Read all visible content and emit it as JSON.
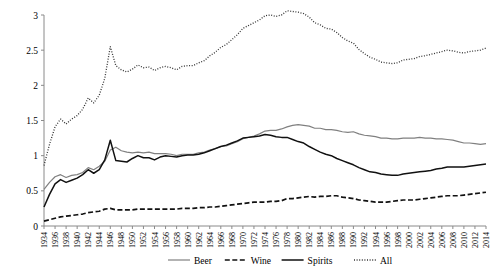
{
  "chart_data": {
    "type": "line",
    "title": "",
    "subtitle": "",
    "xlabel": "",
    "ylabel": "",
    "xlim": [
      1934,
      2014
    ],
    "ylim": [
      0,
      3
    ],
    "yticks": [
      "0",
      "0.5",
      "1",
      "1.5",
      "2",
      "2.5",
      "3"
    ],
    "ytick_values": [
      0,
      0.5,
      1,
      1.5,
      2,
      2.5,
      3
    ],
    "grid": false,
    "legend_position": "bottom",
    "x": [
      1934,
      1935,
      1936,
      1937,
      1938,
      1939,
      1940,
      1941,
      1942,
      1943,
      1944,
      1945,
      1946,
      1947,
      1948,
      1949,
      1950,
      1951,
      1952,
      1953,
      1954,
      1955,
      1956,
      1957,
      1958,
      1959,
      1960,
      1961,
      1962,
      1963,
      1964,
      1965,
      1966,
      1967,
      1968,
      1969,
      1970,
      1971,
      1972,
      1973,
      1974,
      1975,
      1976,
      1977,
      1978,
      1979,
      1980,
      1981,
      1982,
      1983,
      1984,
      1985,
      1986,
      1987,
      1988,
      1989,
      1990,
      1991,
      1992,
      1993,
      1994,
      1995,
      1996,
      1997,
      1998,
      1999,
      2000,
      2001,
      2002,
      2003,
      2004,
      2005,
      2006,
      2007,
      2008,
      2009,
      2010,
      2011,
      2012,
      2013,
      2014
    ],
    "xtick_labels": [
      "1934",
      "1936",
      "1938",
      "1940",
      "1942",
      "1944",
      "1946",
      "1948",
      "1950",
      "1952",
      "1954",
      "1956",
      "1958",
      "1960",
      "1962",
      "1964",
      "1966",
      "1968",
      "1970",
      "1972",
      "1974",
      "1976",
      "1978",
      "1980",
      "1982",
      "1984",
      "1986",
      "1988",
      "1990",
      "1992",
      "1994",
      "1996",
      "1998",
      "2000",
      "2002",
      "2004",
      "2006",
      "2008",
      "2010",
      "2012",
      "2014"
    ],
    "series": [
      {
        "name": "Beer",
        "style": "solid",
        "color": "#808080",
        "values": [
          0.52,
          0.62,
          0.7,
          0.73,
          0.69,
          0.72,
          0.73,
          0.76,
          0.83,
          0.8,
          0.85,
          0.92,
          1.08,
          1.12,
          1.07,
          1.05,
          1.04,
          1.05,
          1.04,
          1.05,
          1.03,
          1.03,
          1.03,
          1.02,
          1.0,
          1.02,
          1.02,
          1.02,
          1.04,
          1.05,
          1.08,
          1.1,
          1.13,
          1.14,
          1.17,
          1.2,
          1.24,
          1.26,
          1.28,
          1.31,
          1.35,
          1.36,
          1.36,
          1.38,
          1.41,
          1.43,
          1.44,
          1.43,
          1.42,
          1.39,
          1.39,
          1.37,
          1.37,
          1.36,
          1.34,
          1.33,
          1.34,
          1.31,
          1.29,
          1.28,
          1.27,
          1.25,
          1.25,
          1.24,
          1.24,
          1.25,
          1.25,
          1.25,
          1.26,
          1.25,
          1.25,
          1.24,
          1.24,
          1.23,
          1.22,
          1.2,
          1.18,
          1.18,
          1.17,
          1.16,
          1.17
        ]
      },
      {
        "name": "Wine",
        "style": "dashed",
        "color": "#111111",
        "values": [
          0.07,
          0.09,
          0.11,
          0.13,
          0.14,
          0.15,
          0.16,
          0.17,
          0.19,
          0.2,
          0.21,
          0.24,
          0.25,
          0.23,
          0.23,
          0.23,
          0.23,
          0.24,
          0.24,
          0.24,
          0.24,
          0.24,
          0.24,
          0.24,
          0.24,
          0.25,
          0.25,
          0.25,
          0.26,
          0.26,
          0.27,
          0.27,
          0.28,
          0.29,
          0.3,
          0.31,
          0.32,
          0.33,
          0.34,
          0.34,
          0.34,
          0.35,
          0.35,
          0.36,
          0.39,
          0.39,
          0.4,
          0.41,
          0.42,
          0.41,
          0.42,
          0.42,
          0.43,
          0.43,
          0.41,
          0.4,
          0.39,
          0.37,
          0.36,
          0.35,
          0.34,
          0.34,
          0.34,
          0.35,
          0.36,
          0.37,
          0.37,
          0.37,
          0.38,
          0.39,
          0.4,
          0.41,
          0.42,
          0.43,
          0.43,
          0.43,
          0.44,
          0.45,
          0.46,
          0.47,
          0.48
        ]
      },
      {
        "name": "Spirits",
        "style": "solid",
        "color": "#111111",
        "values": [
          0.27,
          0.45,
          0.6,
          0.66,
          0.62,
          0.65,
          0.68,
          0.73,
          0.8,
          0.75,
          0.8,
          0.94,
          1.22,
          0.93,
          0.92,
          0.91,
          0.96,
          1.0,
          0.97,
          0.97,
          0.94,
          0.98,
          1.0,
          0.99,
          0.98,
          1.0,
          1.01,
          1.01,
          1.02,
          1.04,
          1.07,
          1.1,
          1.13,
          1.15,
          1.18,
          1.21,
          1.25,
          1.26,
          1.27,
          1.28,
          1.3,
          1.29,
          1.27,
          1.26,
          1.26,
          1.23,
          1.2,
          1.18,
          1.13,
          1.09,
          1.05,
          1.02,
          1.0,
          0.96,
          0.93,
          0.9,
          0.87,
          0.83,
          0.8,
          0.77,
          0.76,
          0.74,
          0.73,
          0.72,
          0.72,
          0.74,
          0.75,
          0.76,
          0.77,
          0.78,
          0.79,
          0.81,
          0.82,
          0.84,
          0.84,
          0.84,
          0.84,
          0.85,
          0.86,
          0.87,
          0.88
        ]
      },
      {
        "name": "All",
        "style": "dotted",
        "color": "#333333",
        "values": [
          0.86,
          1.16,
          1.41,
          1.52,
          1.45,
          1.52,
          1.57,
          1.66,
          1.82,
          1.75,
          1.86,
          2.1,
          2.55,
          2.28,
          2.22,
          2.19,
          2.23,
          2.29,
          2.25,
          2.26,
          2.21,
          2.25,
          2.27,
          2.25,
          2.22,
          2.27,
          2.28,
          2.28,
          2.32,
          2.35,
          2.42,
          2.47,
          2.54,
          2.58,
          2.65,
          2.72,
          2.81,
          2.85,
          2.89,
          2.93,
          2.99,
          3.0,
          2.98,
          3.0,
          3.06,
          3.05,
          3.04,
          3.02,
          2.97,
          2.89,
          2.86,
          2.81,
          2.8,
          2.75,
          2.68,
          2.63,
          2.6,
          2.51,
          2.45,
          2.4,
          2.37,
          2.33,
          2.32,
          2.31,
          2.32,
          2.36,
          2.37,
          2.38,
          2.41,
          2.42,
          2.44,
          2.46,
          2.48,
          2.5,
          2.49,
          2.47,
          2.46,
          2.48,
          2.49,
          2.5,
          2.53
        ]
      }
    ],
    "legend": [
      {
        "label": "Beer",
        "style": "solid",
        "color": "#808080"
      },
      {
        "label": "Wine",
        "style": "dashed",
        "color": "#111111"
      },
      {
        "label": "Spirits",
        "style": "solid",
        "color": "#111111"
      },
      {
        "label": "All",
        "style": "dotted",
        "color": "#333333"
      }
    ]
  }
}
